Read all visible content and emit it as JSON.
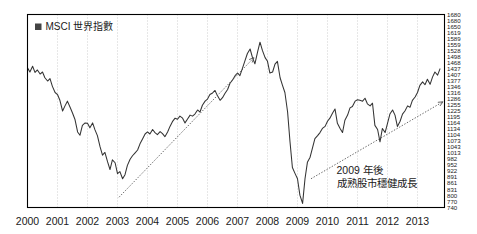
{
  "legend": {
    "marker_icon": "filled-square-icon",
    "label": "MSCI 世界指數",
    "marker_color": "#444444"
  },
  "annotation": {
    "line1": "2009 年後",
    "line2": "成熟股市穩健成長"
  },
  "style": {
    "line_color": "#333333",
    "grid_color": "#bbbbbb",
    "frame_color": "#000000",
    "trend_color": "#555555",
    "text_color": "#1a1a1a",
    "background": "#ffffff"
  },
  "chart_data": {
    "type": "line",
    "title": "",
    "subtitle": "",
    "xlabel": "",
    "ylabel": "",
    "grid": true,
    "legend_position": "top-left",
    "xlim": [
      2000,
      2013.9
    ],
    "ylim": [
      740,
      1680
    ],
    "xtick_labels": [
      "2000",
      "2001",
      "2002",
      "2003",
      "2004",
      "2005",
      "2006",
      "2007",
      "2008",
      "2009",
      "2010",
      "2011",
      "2012",
      "2013"
    ],
    "xticks": [
      2000,
      2001,
      2002,
      2003,
      2004,
      2005,
      2006,
      2007,
      2008,
      2009,
      2010,
      2011,
      2012,
      2013
    ],
    "ytick_labels": [
      "1680",
      "1680",
      "1650",
      "1619",
      "1589",
      "1559",
      "1528",
      "1498",
      "1468",
      "1437",
      "1407",
      "1377",
      "1346",
      "1316",
      "1286",
      "1255",
      "1225",
      "1195",
      "1164",
      "1134",
      "1104",
      "1073",
      "1043",
      "1013",
      "982",
      "952",
      "922",
      "891",
      "861",
      "831",
      "800",
      "770",
      "740"
    ],
    "yticks": [
      1680,
      1680,
      1650,
      1619,
      1589,
      1559,
      1528,
      1498,
      1468,
      1437,
      1407,
      1377,
      1346,
      1316,
      1286,
      1255,
      1225,
      1195,
      1164,
      1134,
      1104,
      1073,
      1043,
      1013,
      982,
      952,
      922,
      891,
      861,
      831,
      800,
      770,
      740
    ],
    "series": [
      {
        "name": "MSCI 世界指數",
        "x": [
          2000.0,
          2000.08,
          2000.17,
          2000.25,
          2000.33,
          2000.42,
          2000.5,
          2000.58,
          2000.67,
          2000.75,
          2000.83,
          2000.92,
          2001.0,
          2001.08,
          2001.17,
          2001.25,
          2001.33,
          2001.42,
          2001.5,
          2001.58,
          2001.67,
          2001.75,
          2001.83,
          2001.92,
          2002.0,
          2002.08,
          2002.17,
          2002.25,
          2002.33,
          2002.42,
          2002.5,
          2002.58,
          2002.67,
          2002.75,
          2002.83,
          2002.92,
          2003.0,
          2003.08,
          2003.17,
          2003.25,
          2003.33,
          2003.42,
          2003.5,
          2003.58,
          2003.67,
          2003.75,
          2003.83,
          2003.92,
          2004.0,
          2004.08,
          2004.17,
          2004.25,
          2004.33,
          2004.42,
          2004.5,
          2004.58,
          2004.67,
          2004.75,
          2004.83,
          2004.92,
          2005.0,
          2005.08,
          2005.17,
          2005.25,
          2005.33,
          2005.42,
          2005.5,
          2005.58,
          2005.67,
          2005.75,
          2005.83,
          2005.92,
          2006.0,
          2006.08,
          2006.17,
          2006.25,
          2006.33,
          2006.42,
          2006.5,
          2006.58,
          2006.67,
          2006.75,
          2006.83,
          2006.92,
          2007.0,
          2007.08,
          2007.17,
          2007.25,
          2007.33,
          2007.42,
          2007.5,
          2007.58,
          2007.67,
          2007.75,
          2007.83,
          2007.92,
          2008.0,
          2008.08,
          2008.17,
          2008.25,
          2008.33,
          2008.42,
          2008.5,
          2008.58,
          2008.67,
          2008.75,
          2008.83,
          2008.92,
          2009.0,
          2009.08,
          2009.17,
          2009.25,
          2009.33,
          2009.42,
          2009.5,
          2009.58,
          2009.67,
          2009.75,
          2009.83,
          2009.92,
          2010.0,
          2010.08,
          2010.17,
          2010.25,
          2010.33,
          2010.42,
          2010.5,
          2010.58,
          2010.67,
          2010.75,
          2010.83,
          2010.92,
          2011.0,
          2011.08,
          2011.17,
          2011.25,
          2011.33,
          2011.42,
          2011.5,
          2011.58,
          2011.67,
          2011.75,
          2011.83,
          2011.92,
          2012.0,
          2012.08,
          2012.17,
          2012.25,
          2012.33,
          2012.42,
          2012.5,
          2012.58,
          2012.67,
          2012.75,
          2012.83,
          2012.92,
          2013.0,
          2013.08,
          2013.17,
          2013.25,
          2013.33,
          2013.42,
          2013.5,
          2013.58,
          2013.67,
          2013.75
        ],
        "values": [
          1420,
          1400,
          1428,
          1398,
          1410,
          1390,
          1400,
          1372,
          1356,
          1368,
          1330,
          1300,
          1290,
          1262,
          1210,
          1235,
          1258,
          1228,
          1200,
          1170,
          1108,
          1092,
          1140,
          1152,
          1150,
          1128,
          1152,
          1118,
          1090,
          1035,
          995,
          1008,
          962,
          925,
          972,
          958,
          905,
          915,
          880,
          900,
          945,
          975,
          992,
          1005,
          1020,
          1050,
          1072,
          1098,
          1108,
          1098,
          1120,
          1105,
          1095,
          1110,
          1100,
          1085,
          1108,
          1135,
          1158,
          1175,
          1170,
          1185,
          1175,
          1152,
          1170,
          1190,
          1185,
          1195,
          1215,
          1205,
          1238,
          1258,
          1268,
          1290,
          1298,
          1310,
          1285,
          1262,
          1275,
          1295,
          1315,
          1345,
          1360,
          1382,
          1395,
          1382,
          1420,
          1455,
          1490,
          1512,
          1470,
          1440,
          1498,
          1545,
          1505,
          1470,
          1452,
          1395,
          1400,
          1438,
          1452,
          1372,
          1335,
          1300,
          1205,
          1060,
          935,
          905,
          880,
          800,
          760,
          880,
          960,
          985,
          1030,
          1075,
          1090,
          1105,
          1125,
          1135,
          1160,
          1175,
          1200,
          1220,
          1150,
          1125,
          1105,
          1165,
          1190,
          1225,
          1232,
          1258,
          1265,
          1262,
          1258,
          1272,
          1245,
          1235,
          1248,
          1140,
          1120,
          1060,
          1125,
          1105,
          1150,
          1195,
          1215,
          1190,
          1135,
          1160,
          1195,
          1210,
          1235,
          1228,
          1262,
          1278,
          1300,
          1335,
          1352,
          1338,
          1365,
          1340,
          1375,
          1400,
          1385,
          1415
        ]
      }
    ],
    "trendlines": [
      {
        "name": "2003-2007 rally trendline",
        "style": "dotted-with-arrow",
        "x_start": 2003.05,
        "y_start": 790,
        "x_end": 2007.55,
        "y_end": 1470
      },
      {
        "name": "2009-2013 steady growth trendline",
        "style": "dotted-with-arrow",
        "x_start": 2009.45,
        "y_start": 880,
        "x_end": 2013.85,
        "y_end": 1255
      }
    ],
    "annotations": [
      {
        "text": "2009 年後",
        "x": 2010.3,
        "y": 905
      },
      {
        "text": "成熟股市穩健成長",
        "x": 2010.3,
        "y": 840
      }
    ]
  }
}
